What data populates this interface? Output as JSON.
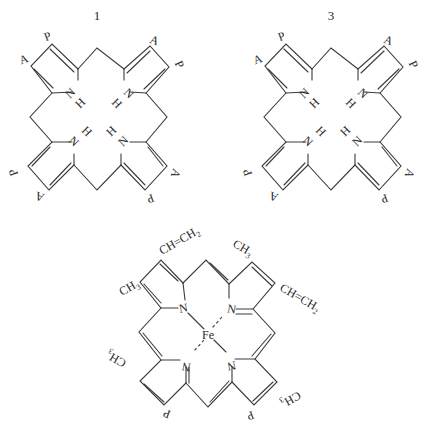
{
  "figure": {
    "structures": [
      {
        "id": "isomer-1",
        "number_label": "1",
        "center_atoms": [
          "N",
          "H",
          "N",
          "H",
          "N",
          "H",
          "N",
          "H"
        ],
        "substituents_clockwise_from_top_left": [
          "A",
          "P",
          "A",
          "P",
          "A",
          "P",
          "A",
          "P"
        ]
      },
      {
        "id": "isomer-3",
        "number_label": "3",
        "center_atoms": [
          "N",
          "H",
          "N",
          "H",
          "N",
          "H",
          "N",
          "H"
        ],
        "substituents_clockwise_from_top_left": [
          "A",
          "P",
          "A",
          "P",
          "A",
          "P",
          "P",
          "A"
        ]
      },
      {
        "id": "heme",
        "number_label": "",
        "metal": "Fe",
        "nitrogen_label": "N",
        "substituents": {
          "top_left_outer": "CH₃",
          "top_left_inner": "CH=CH₂",
          "top_right_inner": "CH₃",
          "top_right_outer": "CH=CH₂",
          "bottom_right_outer": "CH₃",
          "bottom_right_inner": "P",
          "bottom_left_inner": "P",
          "bottom_left_outer": "CH₃"
        }
      }
    ],
    "labels": {
      "A": "A",
      "P": "P",
      "N": "N",
      "H": "H",
      "Fe": "Fe",
      "CH3": "CH",
      "CH3_sub": "3",
      "vinyl": "CH=CH",
      "vinyl_sub": "2"
    },
    "colors": {
      "ink": "#3a3a3a",
      "background": "#ffffff"
    }
  }
}
